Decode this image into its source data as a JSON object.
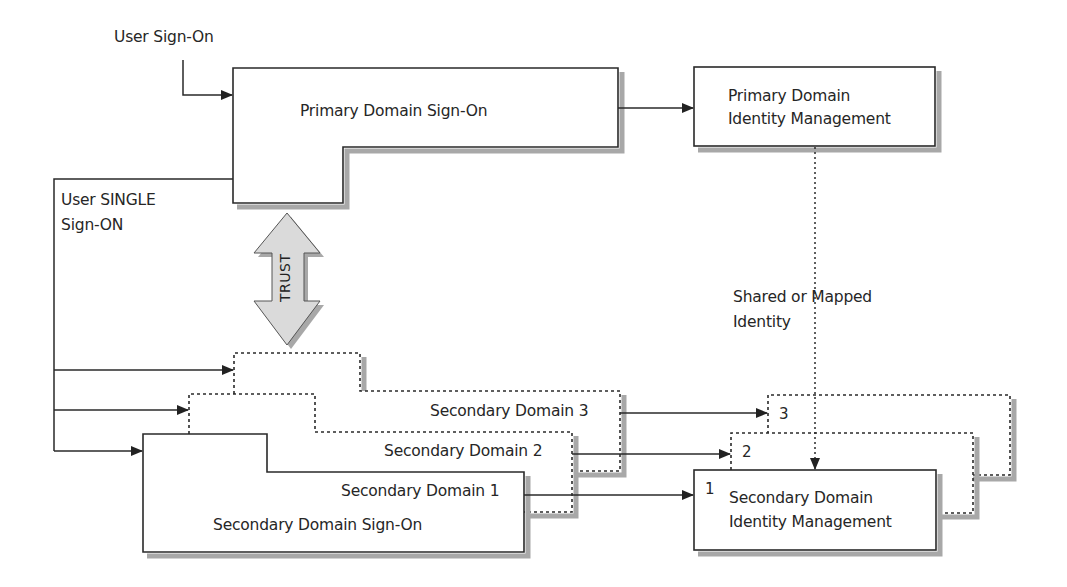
{
  "diagram": {
    "labels": {
      "user_sign_on": "User Sign-On",
      "user_single_sign_on_line1": "User SINGLE",
      "user_single_sign_on_line2": "Sign-ON",
      "primary_sign_on": "Primary Domain Sign-On",
      "primary_idm_line1": "Primary Domain",
      "primary_idm_line2": "Identity Management",
      "trust": "TRUST",
      "shared_identity_line1": "Shared or Mapped",
      "shared_identity_line2": "Identity",
      "secondary_domain_3": "Secondary Domain 3",
      "secondary_domain_2": "Secondary Domain 2",
      "secondary_domain_1": "Secondary Domain 1",
      "secondary_sign_on": "Secondary Domain Sign-On",
      "secondary_idm_line1": "Secondary Domain",
      "secondary_idm_line2": "Identity Management",
      "idm_num_1": "1",
      "idm_num_2": "2",
      "idm_num_3": "3"
    },
    "nodes": [
      {
        "id": "primary-sign-on",
        "label": "Primary Domain Sign-On",
        "style": "solid"
      },
      {
        "id": "primary-idm",
        "label": "Primary Domain Identity Management",
        "style": "solid"
      },
      {
        "id": "secondary-sign-on-1",
        "label": "Secondary Domain 1 / Secondary Domain Sign-On",
        "style": "solid"
      },
      {
        "id": "secondary-sign-on-2",
        "label": "Secondary Domain 2",
        "style": "dotted"
      },
      {
        "id": "secondary-sign-on-3",
        "label": "Secondary Domain 3",
        "style": "dotted"
      },
      {
        "id": "secondary-idm-1",
        "label": "1 Secondary Domain Identity Management",
        "style": "solid"
      },
      {
        "id": "secondary-idm-2",
        "label": "2",
        "style": "dotted"
      },
      {
        "id": "secondary-idm-3",
        "label": "3",
        "style": "dotted"
      }
    ],
    "edges": [
      {
        "from": "user",
        "to": "primary-sign-on",
        "label": "User Sign-On"
      },
      {
        "from": "primary-sign-on",
        "to": "primary-idm"
      },
      {
        "from": "primary-sign-on",
        "to": "secondary-sign-on-1",
        "label": "User SINGLE Sign-ON"
      },
      {
        "from": "primary-sign-on",
        "to": "secondary-sign-on-2"
      },
      {
        "from": "primary-sign-on",
        "to": "secondary-sign-on-3"
      },
      {
        "from": "primary-sign-on",
        "to": "secondary-sign-on-1",
        "label": "TRUST",
        "bidirectional": true
      },
      {
        "from": "primary-idm",
        "to": "secondary-idm-1",
        "label": "Shared or Mapped Identity",
        "style": "dotted"
      },
      {
        "from": "secondary-sign-on-1",
        "to": "secondary-idm-1"
      },
      {
        "from": "secondary-sign-on-2",
        "to": "secondary-idm-2"
      },
      {
        "from": "secondary-sign-on-3",
        "to": "secondary-idm-3"
      }
    ],
    "colors": {
      "line": "#2a2a2a",
      "shadow": "#a8a8a8",
      "trust_fill": "#d9d9d9",
      "background": "#ffffff"
    }
  }
}
